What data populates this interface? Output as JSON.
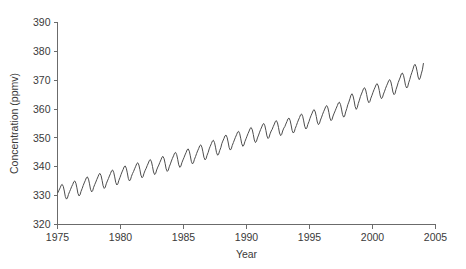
{
  "chart_data": {
    "type": "line",
    "title": "",
    "xlabel": "Year",
    "ylabel": "Concentration (ppmv)",
    "xlim": [
      1975,
      2005
    ],
    "ylim": [
      320,
      390
    ],
    "grid": false,
    "legend": "none",
    "xticks": [
      1975,
      1980,
      1985,
      1990,
      1995,
      2000,
      2005
    ],
    "xtick_labels": [
      "1975",
      "1980",
      "1985",
      "1990",
      "1995",
      "2000",
      "2005"
    ],
    "yticks": [
      320,
      330,
      340,
      350,
      360,
      370,
      380,
      390
    ],
    "ytick_labels": [
      "320",
      "330",
      "340",
      "350",
      "360",
      "370",
      "380",
      "390"
    ],
    "series": [
      {
        "name": "Atmospheric CO2 concentration",
        "color": "#4d4d4d",
        "x": [
          1975.04,
          1975.12,
          1975.21,
          1975.29,
          1975.37,
          1975.46,
          1975.54,
          1975.62,
          1975.71,
          1975.79,
          1975.87,
          1975.96,
          1976.04,
          1976.12,
          1976.21,
          1976.29,
          1976.37,
          1976.46,
          1976.54,
          1976.62,
          1976.71,
          1976.79,
          1976.87,
          1976.96,
          1977.04,
          1977.12,
          1977.21,
          1977.29,
          1977.37,
          1977.46,
          1977.54,
          1977.62,
          1977.71,
          1977.79,
          1977.87,
          1977.96,
          1978.04,
          1978.12,
          1978.21,
          1978.29,
          1978.37,
          1978.46,
          1978.54,
          1978.62,
          1978.71,
          1978.79,
          1978.87,
          1978.96,
          1979.04,
          1979.12,
          1979.21,
          1979.29,
          1979.37,
          1979.46,
          1979.54,
          1979.62,
          1979.71,
          1979.79,
          1979.87,
          1979.96,
          1980.04,
          1980.12,
          1980.21,
          1980.29,
          1980.37,
          1980.46,
          1980.54,
          1980.62,
          1980.71,
          1980.79,
          1980.87,
          1980.96,
          1981.04,
          1981.12,
          1981.21,
          1981.29,
          1981.37,
          1981.46,
          1981.54,
          1981.62,
          1981.71,
          1981.79,
          1981.87,
          1981.96,
          1982.04,
          1982.12,
          1982.21,
          1982.29,
          1982.37,
          1982.46,
          1982.54,
          1982.62,
          1982.71,
          1982.79,
          1982.87,
          1982.96,
          1983.04,
          1983.12,
          1983.21,
          1983.29,
          1983.37,
          1983.46,
          1983.54,
          1983.62,
          1983.71,
          1983.79,
          1983.87,
          1983.96,
          1984.04,
          1984.12,
          1984.21,
          1984.29,
          1984.37,
          1984.46,
          1984.54,
          1984.62,
          1984.71,
          1984.79,
          1984.87,
          1984.96,
          1985.04,
          1985.12,
          1985.21,
          1985.29,
          1985.37,
          1985.46,
          1985.54,
          1985.62,
          1985.71,
          1985.79,
          1985.87,
          1985.96,
          1986.04,
          1986.12,
          1986.21,
          1986.29,
          1986.37,
          1986.46,
          1986.54,
          1986.62,
          1986.71,
          1986.79,
          1986.87,
          1986.96,
          1987.04,
          1987.12,
          1987.21,
          1987.29,
          1987.37,
          1987.46,
          1987.54,
          1987.62,
          1987.71,
          1987.79,
          1987.87,
          1987.96,
          1988.04,
          1988.12,
          1988.21,
          1988.29,
          1988.37,
          1988.46,
          1988.54,
          1988.62,
          1988.71,
          1988.79,
          1988.87,
          1988.96,
          1989.04,
          1989.12,
          1989.21,
          1989.29,
          1989.37,
          1989.46,
          1989.54,
          1989.62,
          1989.71,
          1989.79,
          1989.87,
          1989.96,
          1990.04,
          1990.12,
          1990.21,
          1990.29,
          1990.37,
          1990.46,
          1990.54,
          1990.62,
          1990.71,
          1990.79,
          1990.87,
          1990.96,
          1991.04,
          1991.12,
          1991.21,
          1991.29,
          1991.37,
          1991.46,
          1991.54,
          1991.62,
          1991.71,
          1991.79,
          1991.87,
          1991.96,
          1992.04,
          1992.12,
          1992.21,
          1992.29,
          1992.37,
          1992.46,
          1992.54,
          1992.62,
          1992.71,
          1992.79,
          1992.87,
          1992.96,
          1993.04,
          1993.12,
          1993.21,
          1993.29,
          1993.37,
          1993.46,
          1993.54,
          1993.62,
          1993.71,
          1993.79,
          1993.87,
          1993.96,
          1994.04,
          1994.12,
          1994.21,
          1994.29,
          1994.37,
          1994.46,
          1994.54,
          1994.62,
          1994.71,
          1994.79,
          1994.87,
          1994.96,
          1995.04,
          1995.12,
          1995.21,
          1995.29,
          1995.37,
          1995.46,
          1995.54,
          1995.62,
          1995.71,
          1995.79,
          1995.87,
          1995.96,
          1996.04,
          1996.12,
          1996.21,
          1996.29,
          1996.37,
          1996.46,
          1996.54,
          1996.62,
          1996.71,
          1996.79,
          1996.87,
          1996.96,
          1997.04,
          1997.12,
          1997.21,
          1997.29,
          1997.37,
          1997.46,
          1997.54,
          1997.62,
          1997.71,
          1997.79,
          1997.87,
          1997.96,
          1998.04,
          1998.12,
          1998.21,
          1998.29,
          1998.37,
          1998.46,
          1998.54,
          1998.62,
          1998.71,
          1998.79,
          1998.87,
          1998.96,
          1999.04,
          1999.12,
          1999.21,
          1999.29,
          1999.37,
          1999.46,
          1999.54,
          1999.62,
          1999.71,
          1999.79,
          1999.87,
          1999.96,
          2000.04,
          2000.12,
          2000.21,
          2000.29,
          2000.37,
          2000.46,
          2000.54,
          2000.62,
          2000.71,
          2000.79,
          2000.87,
          2000.96,
          2001.04,
          2001.12,
          2001.21,
          2001.29,
          2001.37,
          2001.46,
          2001.54,
          2001.62,
          2001.71,
          2001.79,
          2001.87,
          2001.96,
          2002.04,
          2002.12,
          2002.21,
          2002.29,
          2002.37,
          2002.46,
          2002.54,
          2002.62,
          2002.71,
          2002.79,
          2002.87,
          2002.96,
          2003.04,
          2003.12,
          2003.21,
          2003.29,
          2003.37,
          2003.46,
          2003.54,
          2003.62,
          2003.71,
          2003.79,
          2003.87,
          2003.96,
          2004.04
        ],
        "y": [
          331.1,
          331.9,
          332.7,
          333.6,
          333.9,
          333.2,
          331.6,
          329.7,
          328.8,
          329.2,
          330.4,
          331.4,
          332.2,
          333.1,
          333.9,
          334.8,
          335.1,
          334.3,
          332.7,
          330.8,
          329.9,
          330.3,
          331.5,
          332.5,
          333.5,
          334.4,
          335.3,
          336.2,
          336.5,
          335.7,
          334.1,
          332.2,
          331.3,
          331.7,
          332.9,
          333.9,
          334.7,
          335.6,
          336.5,
          337.4,
          337.7,
          336.9,
          335.3,
          333.4,
          332.5,
          332.9,
          334.1,
          335.1,
          335.9,
          336.8,
          337.7,
          338.6,
          338.9,
          338.1,
          336.5,
          334.6,
          333.7,
          334.1,
          335.3,
          336.3,
          337.3,
          338.2,
          339.1,
          340.0,
          340.3,
          339.5,
          337.9,
          336.0,
          335.1,
          335.5,
          336.7,
          337.7,
          338.4,
          339.3,
          340.2,
          341.1,
          341.4,
          340.6,
          339.0,
          337.1,
          336.2,
          336.6,
          337.8,
          338.8,
          339.5,
          340.4,
          341.3,
          342.2,
          342.5,
          341.7,
          340.1,
          338.2,
          337.3,
          337.7,
          338.9,
          339.9,
          340.6,
          341.5,
          342.4,
          343.3,
          343.6,
          342.8,
          341.2,
          339.3,
          338.4,
          338.8,
          340.0,
          341.0,
          342.0,
          342.9,
          343.8,
          344.7,
          345.0,
          344.2,
          342.6,
          340.7,
          339.8,
          340.2,
          341.4,
          342.4,
          343.2,
          344.1,
          345.0,
          345.9,
          346.2,
          345.4,
          343.8,
          341.9,
          341.0,
          341.4,
          342.6,
          343.6,
          344.6,
          345.5,
          346.4,
          347.3,
          347.6,
          346.8,
          345.2,
          343.3,
          342.4,
          342.8,
          344.0,
          345.0,
          346.2,
          347.1,
          348.0,
          348.9,
          349.2,
          348.4,
          346.8,
          344.9,
          344.0,
          344.4,
          345.6,
          346.6,
          348.0,
          348.9,
          349.8,
          350.7,
          351.0,
          350.2,
          348.6,
          346.7,
          345.8,
          346.2,
          347.4,
          348.4,
          349.3,
          350.2,
          351.1,
          352.0,
          352.3,
          351.5,
          349.9,
          348.0,
          347.1,
          347.5,
          348.7,
          349.7,
          350.6,
          351.5,
          352.4,
          353.3,
          353.6,
          352.8,
          351.2,
          349.3,
          348.4,
          348.8,
          350.0,
          351.0,
          352.0,
          352.9,
          353.8,
          354.7,
          355.0,
          354.2,
          352.6,
          350.7,
          349.8,
          350.2,
          351.4,
          352.4,
          353.0,
          353.9,
          354.8,
          355.7,
          356.0,
          355.2,
          353.6,
          351.7,
          350.8,
          351.2,
          352.4,
          353.4,
          353.9,
          354.8,
          355.7,
          356.6,
          356.9,
          356.1,
          354.5,
          352.6,
          351.7,
          352.1,
          353.3,
          354.3,
          355.3,
          356.2,
          357.1,
          358.0,
          358.3,
          357.5,
          355.9,
          354.0,
          353.1,
          353.5,
          354.7,
          355.7,
          356.8,
          357.7,
          358.6,
          359.5,
          359.8,
          359.0,
          357.4,
          355.5,
          354.6,
          355.0,
          356.2,
          357.2,
          358.2,
          359.1,
          360.0,
          360.9,
          361.2,
          360.4,
          358.8,
          356.9,
          356.0,
          356.4,
          357.6,
          358.6,
          359.4,
          360.3,
          361.2,
          362.1,
          362.4,
          361.6,
          360.0,
          358.1,
          357.2,
          357.6,
          359.0,
          360.2,
          361.5,
          362.4,
          363.6,
          364.8,
          365.3,
          364.5,
          362.9,
          360.9,
          359.9,
          360.5,
          361.9,
          363.1,
          364.3,
          365.2,
          366.2,
          367.1,
          367.4,
          366.6,
          365.0,
          363.1,
          362.2,
          362.6,
          363.8,
          364.8,
          365.8,
          366.7,
          367.6,
          368.5,
          368.8,
          368.0,
          366.4,
          364.5,
          363.6,
          364.0,
          365.2,
          366.2,
          367.2,
          368.1,
          369.0,
          369.9,
          370.2,
          369.4,
          367.8,
          365.9,
          365.0,
          365.4,
          366.8,
          368.0,
          369.2,
          370.1,
          371.1,
          372.2,
          372.5,
          371.7,
          370.1,
          368.2,
          367.3,
          367.7,
          369.1,
          370.3,
          371.6,
          372.6,
          373.8,
          375.0,
          375.5,
          374.7,
          373.1,
          371.1,
          370.2,
          370.8,
          372.2,
          373.6,
          375.8
        ]
      }
    ]
  },
  "axes": {
    "y_title": "Concentration (ppmv)",
    "x_title": "Year"
  }
}
